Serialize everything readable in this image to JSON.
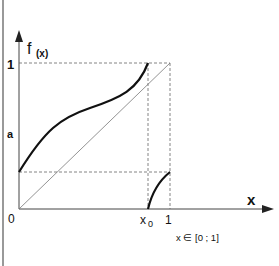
{
  "diagram": {
    "y_axis_label": "f",
    "y_axis_subscript": "(x)",
    "x_axis_label": "x",
    "tick_y_one": "1",
    "tick_y_a": "a",
    "origin": "0",
    "tick_x0": "x",
    "tick_x0_sub": "0",
    "tick_x_one": "1",
    "domain_note": "x ∈ [0 ; 1]"
  }
}
